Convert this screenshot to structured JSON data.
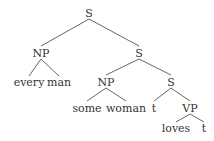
{
  "tree": {
    "nodes": [
      {
        "id": "s1",
        "label": "S",
        "x": 89,
        "y": 13
      },
      {
        "id": "np1",
        "label": "NP",
        "x": 41,
        "y": 53
      },
      {
        "id": "every",
        "label": "every",
        "x": 29,
        "y": 82
      },
      {
        "id": "man",
        "label": "man",
        "x": 59,
        "y": 82
      },
      {
        "id": "s2",
        "label": "S",
        "x": 139,
        "y": 53
      },
      {
        "id": "np2",
        "label": "NP",
        "x": 106,
        "y": 82
      },
      {
        "id": "some",
        "label": "some",
        "x": 87,
        "y": 108
      },
      {
        "id": "woman",
        "label": "woman",
        "x": 126,
        "y": 108
      },
      {
        "id": "s3",
        "label": "S",
        "x": 171,
        "y": 82
      },
      {
        "id": "t1",
        "label": "t",
        "x": 154,
        "y": 108
      },
      {
        "id": "vp",
        "label": "VP",
        "x": 190,
        "y": 108
      },
      {
        "id": "loves",
        "label": "loves",
        "x": 176,
        "y": 128
      },
      {
        "id": "t2",
        "label": "t",
        "x": 204,
        "y": 128
      }
    ],
    "edges": [
      [
        89,
        19,
        41,
        46
      ],
      [
        89,
        19,
        139,
        46
      ],
      [
        41,
        59,
        29,
        76
      ],
      [
        41,
        59,
        59,
        76
      ],
      [
        139,
        59,
        106,
        75
      ],
      [
        139,
        59,
        171,
        75
      ],
      [
        106,
        88,
        87,
        101
      ],
      [
        106,
        88,
        126,
        101
      ],
      [
        171,
        88,
        154,
        101
      ],
      [
        171,
        88,
        190,
        101
      ],
      [
        190,
        114,
        176,
        122
      ],
      [
        190,
        114,
        204,
        122
      ]
    ]
  }
}
